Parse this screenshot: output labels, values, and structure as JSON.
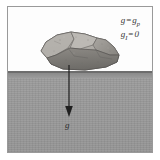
{
  "figure": {
    "caption_equations": [
      {
        "lhs": "g",
        "operator": "=",
        "rhs": "g",
        "rhs_sub": "p"
      },
      {
        "lhs": "g",
        "lhs_sub": "I",
        "operator": "=",
        "rhs": "0"
      }
    ],
    "vector_label": "g",
    "objects": {
      "rock_label": "rock",
      "ground_label": "ground",
      "arrow_label": "gravity-vector"
    },
    "colors": {
      "frame_border": "#9a9a9a",
      "sky": "#fdfdfd",
      "ground": "#9a9a9a",
      "ground_surface_line": "#6d6d6d",
      "rock_light": "#b9b6b1",
      "rock_mid": "#9d9a95",
      "rock_dark": "#706e6b",
      "rock_outline": "#5a5855",
      "arrow": "#1f1f1f",
      "text": "#333333"
    }
  }
}
